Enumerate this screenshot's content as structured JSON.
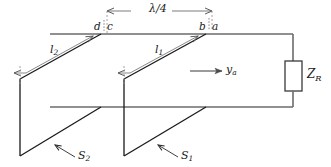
{
  "figure": {
    "type": "circuit-schematic"
  },
  "colors": {
    "main_line": "#6b6b6b",
    "stub_line": "#1a1a1a",
    "dimension_line": "#7a7a7a",
    "dashed_tick": "#8a8a8a",
    "text": "#1a1a1a",
    "background": "#ffffff"
  },
  "labels": {
    "quarter_wave": "λ/4",
    "point_d": "d",
    "point_c": "c",
    "point_b": "b",
    "point_a": "a",
    "length_l2": "l",
    "length_l2_sub": "2",
    "length_l1": "l",
    "length_l1_sub": "1",
    "admittance": "y",
    "admittance_sub": "a",
    "load": "Z",
    "load_sub": "R",
    "stub_s2": "S",
    "stub_s2_sub": "2",
    "stub_s1": "S",
    "stub_s1_sub": "1"
  },
  "annotations": {
    "quarter_wave_span": "Spacing between stub pairs equals one quarter wavelength",
    "direction_arrow": "Direction of increasing normalized admittance y_a toward load",
    "load_element": "Terminating load impedance Z_R"
  }
}
